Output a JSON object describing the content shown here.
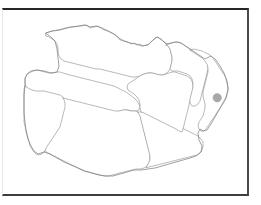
{
  "figure": {
    "type": "administrative-map",
    "title": "",
    "width": 261,
    "height": 205,
    "background_color": "#ffffff",
    "frame": {
      "visible": true,
      "color_top": "#262626",
      "color_right": "#4a4a4a",
      "color_bottom": "#3d3d3d",
      "color_left": "#e8e8e8",
      "x": 2,
      "y": 8,
      "width": 247,
      "height": 188
    }
  },
  "map": {
    "fill_color": "#ffffff",
    "boundary_color": "#8c8c8c",
    "outline_color": "#808080",
    "label_text": "",
    "regions": [
      {
        "name": "northwest-region",
        "label": ""
      },
      {
        "name": "west-region",
        "label": ""
      },
      {
        "name": "southwest-region",
        "label": ""
      },
      {
        "name": "south-central-region",
        "label": ""
      },
      {
        "name": "southeast-region",
        "label": ""
      },
      {
        "name": "east-central-region",
        "label": ""
      },
      {
        "name": "northeast-region",
        "label": ""
      },
      {
        "name": "far-northeast-region",
        "label": ""
      }
    ]
  },
  "markers": [
    {
      "name": "location-marker",
      "label": "",
      "cx": 217.2,
      "cy": 97.8,
      "r": 4.2,
      "fill": "#a8a8a8",
      "stroke": "#999999"
    }
  ],
  "legend": {
    "visible": false,
    "items": []
  },
  "axes": {
    "visible": false,
    "x_ticks": [],
    "y_ticks": []
  }
}
